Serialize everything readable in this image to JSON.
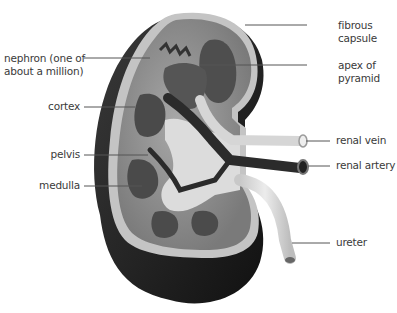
{
  "diagram": {
    "labels": {
      "nephron_line1": "nephron (one of",
      "nephron_line2": "about a million)",
      "cortex": "cortex",
      "pelvis": "pelvis",
      "medulla": "medulla",
      "fibrous_capsule_line1": "fibrous",
      "fibrous_capsule_line2": "capsule",
      "apex_line1": "apex of",
      "apex_line2": "pyramid",
      "renal_vein": "renal vein",
      "renal_artery": "renal artery",
      "ureter": "ureter"
    },
    "colors": {
      "outer_dark": "#1f1f1f",
      "capsule": "#bdbdbd",
      "cortex": "#8c8c8c",
      "pyramid": "#4a4a4a",
      "pelvis_light": "#d8d8d8",
      "vessel_dark": "#2c2c2c",
      "vein_light": "#d6d6d6",
      "leader_line": "#555555",
      "text": "#3a3a3a"
    }
  }
}
